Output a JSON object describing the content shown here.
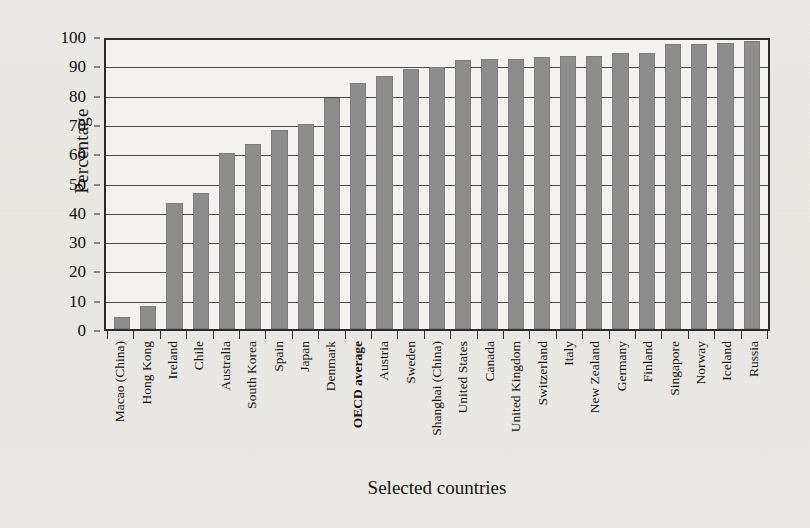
{
  "chart_data": {
    "type": "bar",
    "title": "",
    "xlabel": "Selected countries",
    "ylabel": "Percentage",
    "ylim": [
      0,
      100
    ],
    "yticks": [
      0,
      10,
      20,
      30,
      40,
      50,
      60,
      70,
      80,
      90,
      100
    ],
    "grid": true,
    "legend": false,
    "bar_color": "#8d8d8d",
    "highlight_category": "OECD average",
    "categories": [
      "Macao (China)",
      "Hong Kong",
      "Ireland",
      "Chile",
      "Australia",
      "South Korea",
      "Spain",
      "Japan",
      "Denmark",
      "OECD average",
      "Austria",
      "Sweden",
      "Shanghai (China)",
      "United States",
      "Canada",
      "United Kingdom",
      "Switzerland",
      "Italy",
      "New Zealand",
      "Germany",
      "Finland",
      "Singapore",
      "Norway",
      "Iceland",
      "Russia"
    ],
    "values": [
      4,
      8,
      43.5,
      47,
      61,
      64,
      69,
      71,
      80,
      85,
      87.5,
      90,
      90.5,
      93,
      93.5,
      93.5,
      94,
      94.5,
      94.5,
      95.5,
      95.5,
      98.5,
      98.5,
      99,
      99.5
    ]
  },
  "axis": {
    "y_title": "Percentage",
    "x_title": "Selected countries"
  }
}
